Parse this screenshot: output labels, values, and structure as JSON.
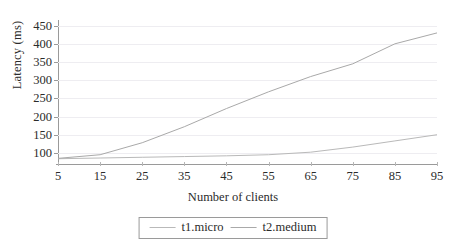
{
  "chart_data": {
    "type": "line",
    "title": "",
    "xlabel": "Number of clients",
    "ylabel": "Latency (ms)",
    "x": [
      5,
      15,
      25,
      35,
      45,
      55,
      65,
      75,
      85,
      95
    ],
    "xlim": [
      5,
      95
    ],
    "ylim": [
      75,
      460
    ],
    "xticks": [
      "5",
      "15",
      "25",
      "35",
      "45",
      "55",
      "65",
      "75",
      "85",
      "95"
    ],
    "yticks": [
      "100",
      "150",
      "200",
      "250",
      "300",
      "350",
      "400",
      "450"
    ],
    "grid": true,
    "legend_position": "bottom-center",
    "series": [
      {
        "name": "t1.micro",
        "color": "#b9b9b9",
        "values": [
          84,
          86,
          88,
          90,
          92,
          95,
          102,
          116,
          133,
          150
        ]
      },
      {
        "name": "t2.medium",
        "color": "#a9a9a9",
        "values": [
          85,
          95,
          128,
          172,
          222,
          268,
          310,
          345,
          400,
          430
        ]
      }
    ]
  },
  "legend": {
    "items": [
      {
        "label": "t1.micro"
      },
      {
        "label": "t2.medium"
      }
    ]
  }
}
